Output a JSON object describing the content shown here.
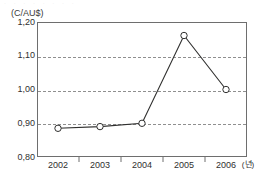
{
  "figure": {
    "top_fragment_text": "· · · · · · · ·",
    "unit_label": "(C/AU$)",
    "x_axis_unit": "(년)"
  },
  "chart_data": {
    "type": "line",
    "title": "",
    "subtitle": "",
    "xlabel": "(년)",
    "ylabel": "(C/AU$)",
    "categories": [
      "2002",
      "2003",
      "2004",
      "2005",
      "2006"
    ],
    "values": [
      0.885,
      0.89,
      0.9,
      1.16,
      1.0
    ],
    "series": [
      {
        "name": "C/AU$",
        "values": [
          0.885,
          0.89,
          0.9,
          1.16,
          1.0
        ],
        "marker": "open-circle",
        "line_color": "#30302f"
      }
    ],
    "ylim": [
      0.8,
      1.2
    ],
    "ytick_labels": [
      "1,20",
      "1,10",
      "1,00",
      "0,90",
      "0,80"
    ],
    "ytick_values": [
      1.2,
      1.1,
      1.0,
      0.9,
      0.8
    ],
    "xtick_labels": [
      "2002",
      "2003",
      "2004",
      "2005",
      "2006"
    ],
    "gridlines": {
      "horizontal": true,
      "vertical": false,
      "style": "dashed",
      "color": "#8f8f8f",
      "at_values": [
        1.1,
        1.0,
        0.9
      ]
    },
    "legend": {
      "visible": false,
      "position": "none"
    },
    "frame_color": "#6e6e6e",
    "background": "#ffffff"
  }
}
